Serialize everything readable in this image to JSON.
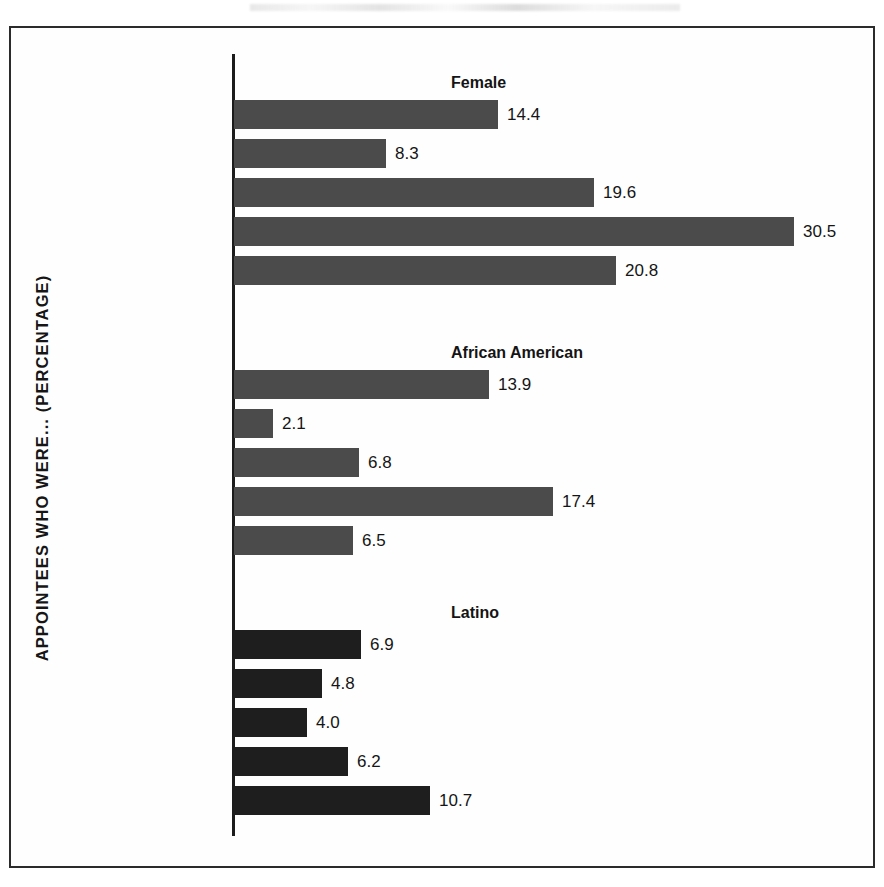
{
  "figure": {
    "y_axis_title": "APPOINTEES WHO WERE... (PERCENTAGE)",
    "frame_color": "#2b2b2b",
    "background": "#ffffff"
  },
  "chart_data": {
    "type": "bar",
    "orientation": "horizontal",
    "title": "",
    "subtitle": "",
    "xlabel": "",
    "ylabel": "APPOINTEES WHO WERE... (PERCENTAGE)",
    "xlim": [
      0,
      30.5
    ],
    "grid": false,
    "legend": false,
    "axis_ticks_visible": false,
    "categories": [
      "Carter",
      "Reagan",
      "G. H. W. Bush",
      "Clinton",
      "G. W. Bush"
    ],
    "panels": [
      {
        "name": "Female",
        "bar_color": "#4b4b4b",
        "values": [
          14.4,
          8.3,
          19.6,
          30.5,
          20.8
        ],
        "labels": [
          "14.4",
          "8.3",
          "19.6",
          "30.5",
          "20.8"
        ]
      },
      {
        "name": "African American",
        "bar_color": "#4b4b4b",
        "values": [
          13.9,
          2.1,
          6.8,
          17.4,
          6.5
        ],
        "labels": [
          "13.9",
          "2.1",
          "6.8",
          "17.4",
          "6.5"
        ]
      },
      {
        "name": "Latino",
        "bar_color": "#1e1e1e",
        "values": [
          6.9,
          4.8,
          4.0,
          6.2,
          10.7
        ],
        "labels": [
          "6.9",
          "4.8",
          "4.0",
          "6.2",
          "10.7"
        ]
      }
    ],
    "series": [
      {
        "name": "Female",
        "values": [
          14.4,
          8.3,
          19.6,
          30.5,
          20.8
        ]
      },
      {
        "name": "African American",
        "values": [
          13.9,
          2.1,
          6.8,
          17.4,
          6.5
        ]
      },
      {
        "name": "Latino",
        "values": [
          6.9,
          4.8,
          4.0,
          6.2,
          10.7
        ]
      }
    ]
  }
}
